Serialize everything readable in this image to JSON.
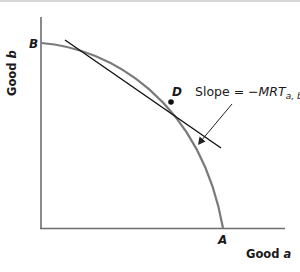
{
  "diagram": {
    "type": "production-possibilities-frontier",
    "axes": {
      "x_label_prefix": "Good ",
      "x_label_var": "a",
      "y_label_prefix": "Good ",
      "y_label_var": "b"
    },
    "points": {
      "B": "B",
      "A": "A",
      "D": "D"
    },
    "annotation": {
      "prefix": "Slope = −",
      "main": "MRT",
      "subscript": "a, b"
    },
    "colors": {
      "curve": "#7a7a7a",
      "tangent": "#111111",
      "axis": "#6e6e6e",
      "text": "#1a1a1a"
    }
  }
}
